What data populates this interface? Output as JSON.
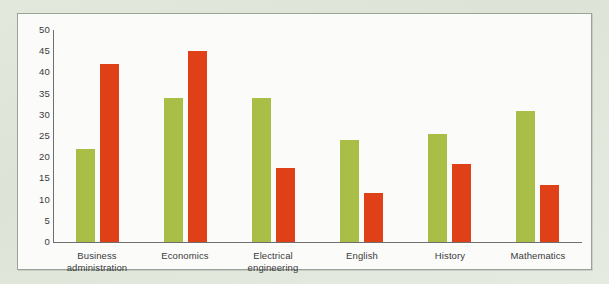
{
  "chart_data": {
    "type": "bar",
    "title": "",
    "subtitle": "",
    "xlabel": "",
    "ylabel": "",
    "ylim": [
      0,
      50
    ],
    "ytick_step": 5,
    "yticks": [
      50,
      45,
      40,
      35,
      30,
      25,
      20,
      15,
      10,
      5,
      0
    ],
    "grid": false,
    "legend": null,
    "legend_position": "none",
    "categories": [
      "Business\nadministration",
      "Economics",
      "Electrical\nengineering",
      "English",
      "History",
      "Mathematics"
    ],
    "series": [
      {
        "name": "green-series",
        "color": "#a8be46",
        "values": [
          22,
          34,
          34,
          24,
          25.5,
          31
        ]
      },
      {
        "name": "red-series",
        "color": "#df4017",
        "values": [
          42,
          45,
          17.5,
          11.5,
          18.5,
          13.5
        ]
      }
    ]
  },
  "colors": {
    "green": "#a8be46",
    "red": "#df4017",
    "axis": "#6f6f6f",
    "text": "#3a3a3a",
    "panel_background": "#fbfbfa",
    "panel_border": "#9aa39a",
    "page_background": "#dfe6da"
  }
}
